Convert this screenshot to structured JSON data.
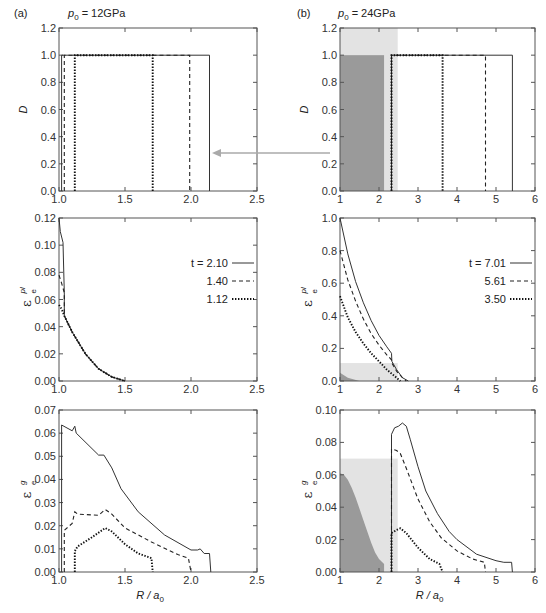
{
  "figure": {
    "panel_a_label": "(a)",
    "panel_b_label": "(b)",
    "panel_a_title": "p0 = 12GPa",
    "panel_b_title": "p0 = 24GPa",
    "panel_a_title_sym": "p",
    "panel_a_title_sub": "0",
    "panel_a_title_rest": " = 12GPa",
    "panel_b_title_sym": "p",
    "panel_b_title_sub": "0",
    "panel_b_title_rest": " = 24GPa",
    "xlabel": "R / a0",
    "caption_fragment": "... distribution of damage D, plastic strain εe^pl and ... strain εe^g at radial distance R/a0 ..."
  },
  "colors": {
    "axis": "#555555",
    "curve": "#222222",
    "arrow": "#aaaaaa",
    "shade_dark": "#9a9a9a",
    "shade_light": "#e3e3e3"
  },
  "chart_data": [
    {
      "id": "a_top",
      "type": "line",
      "title": "p0 = 12GPa",
      "xlabel": "",
      "ylabel": "D",
      "xlim": [
        1.0,
        2.5
      ],
      "ylim": [
        0.0,
        1.2
      ],
      "xticks": [
        "1.0",
        "1.5",
        "2.0",
        "2.5"
      ],
      "yticks": [
        "0.0",
        "0.2",
        "0.4",
        "0.6",
        "0.8",
        "1.0",
        "1.2"
      ],
      "series": [
        {
          "name": "t = 2.10",
          "style": "solid",
          "points": [
            [
              1.02,
              0
            ],
            [
              1.02,
              1.0
            ],
            [
              2.14,
              1.0
            ],
            [
              2.14,
              0
            ]
          ]
        },
        {
          "name": "t = 1.40",
          "style": "dashed",
          "points": [
            [
              1.04,
              0
            ],
            [
              1.04,
              1.0
            ],
            [
              1.99,
              1.0
            ],
            [
              1.99,
              0
            ]
          ]
        },
        {
          "name": "t = 1.12",
          "style": "dotted",
          "points": [
            [
              1.12,
              0
            ],
            [
              1.12,
              1.0
            ],
            [
              1.71,
              1.0
            ],
            [
              1.71,
              0
            ]
          ]
        }
      ]
    },
    {
      "id": "a_mid",
      "type": "line",
      "xlabel": "",
      "ylabel": "εe^pl",
      "xlim": [
        1.0,
        2.5
      ],
      "ylim": [
        0.0,
        0.12
      ],
      "xticks": [
        "1.0",
        "1.5",
        "2.0",
        "2.5"
      ],
      "yticks": [
        "0.00",
        "0.02",
        "0.04",
        "0.06",
        "0.08",
        "0.10",
        "0.12"
      ],
      "legend": [
        {
          "label": "t = 2.10",
          "style": "solid"
        },
        {
          "label": "1.40",
          "style": "dashed"
        },
        {
          "label": "1.12",
          "style": "dotted"
        }
      ],
      "series": [
        {
          "name": "t = 2.10",
          "style": "solid",
          "points": [
            [
              1.0,
              0.12
            ],
            [
              1.01,
              0.11
            ],
            [
              1.03,
              0.102
            ],
            [
              1.04,
              0.065
            ],
            [
              1.04,
              0.048
            ],
            [
              1.1,
              0.036
            ],
            [
              1.2,
              0.02
            ],
            [
              1.3,
              0.009
            ],
            [
              1.4,
              0.003
            ],
            [
              1.5,
              0.0
            ]
          ]
        },
        {
          "name": "t = 1.40",
          "style": "dashed",
          "points": [
            [
              1.0,
              0.078
            ],
            [
              1.02,
              0.072
            ],
            [
              1.04,
              0.065
            ],
            [
              1.04,
              0.048
            ],
            [
              1.1,
              0.036
            ],
            [
              1.2,
              0.02
            ],
            [
              1.3,
              0.009
            ],
            [
              1.4,
              0.003
            ],
            [
              1.5,
              0.0
            ]
          ]
        },
        {
          "name": "t = 1.12",
          "style": "dotted",
          "points": [
            [
              1.0,
              0.056
            ],
            [
              1.02,
              0.053
            ],
            [
              1.04,
              0.048
            ],
            [
              1.1,
              0.036
            ],
            [
              1.2,
              0.02
            ],
            [
              1.3,
              0.009
            ],
            [
              1.4,
              0.003
            ],
            [
              1.5,
              0.0
            ]
          ]
        }
      ]
    },
    {
      "id": "a_bot",
      "type": "line",
      "xlabel": "R / a0",
      "ylabel": "εe^g",
      "xlim": [
        1.0,
        2.5
      ],
      "ylim": [
        0.0,
        0.07
      ],
      "xticks": [
        "1.0",
        "1.5",
        "2.0",
        "2.5"
      ],
      "yticks": [
        "0.00",
        "0.01",
        "0.02",
        "0.03",
        "0.04",
        "0.05",
        "0.06",
        "0.07"
      ],
      "series": [
        {
          "name": "t = 2.10",
          "style": "solid",
          "points": [
            [
              1.02,
              0
            ],
            [
              1.02,
              0.0635
            ],
            [
              1.1,
              0.061
            ],
            [
              1.12,
              0.063
            ],
            [
              1.13,
              0.06
            ],
            [
              1.3,
              0.0505
            ],
            [
              1.34,
              0.0505
            ],
            [
              1.4,
              0.045
            ],
            [
              1.47,
              0.036
            ],
            [
              1.6,
              0.026
            ],
            [
              1.8,
              0.016
            ],
            [
              2.0,
              0.0095
            ],
            [
              2.05,
              0.0095
            ],
            [
              2.07,
              0.01
            ],
            [
              2.1,
              0.008
            ],
            [
              2.14,
              0.008
            ],
            [
              2.15,
              0
            ]
          ]
        },
        {
          "name": "t = 1.40",
          "style": "dashed",
          "points": [
            [
              1.04,
              0
            ],
            [
              1.04,
              0.018
            ],
            [
              1.1,
              0.021
            ],
            [
              1.12,
              0.026
            ],
            [
              1.14,
              0.025
            ],
            [
              1.3,
              0.0245
            ],
            [
              1.35,
              0.027
            ],
            [
              1.4,
              0.025
            ],
            [
              1.5,
              0.019
            ],
            [
              1.7,
              0.013
            ],
            [
              1.9,
              0.0075
            ],
            [
              1.98,
              0.006
            ],
            [
              2.0,
              0.0
            ]
          ]
        },
        {
          "name": "t = 1.12",
          "style": "dotted",
          "points": [
            [
              1.12,
              0
            ],
            [
              1.12,
              0.009
            ],
            [
              1.14,
              0.011
            ],
            [
              1.25,
              0.015
            ],
            [
              1.35,
              0.019
            ],
            [
              1.4,
              0.0175
            ],
            [
              1.5,
              0.012
            ],
            [
              1.6,
              0.008
            ],
            [
              1.7,
              0.006
            ],
            [
              1.71,
              0.0
            ]
          ]
        }
      ]
    },
    {
      "id": "b_top",
      "type": "line",
      "title": "p0 = 24GPa",
      "xlabel": "",
      "ylabel": "D",
      "xlim": [
        1,
        6
      ],
      "ylim": [
        0.0,
        1.2
      ],
      "xticks": [
        "1",
        "2",
        "3",
        "4",
        "5",
        "6"
      ],
      "yticks": [
        "0.0",
        "0.2",
        "0.4",
        "0.6",
        "0.8",
        "1.0",
        "1.2"
      ],
      "shaded_regions": [
        {
          "shade": "light",
          "x": [
            1.0,
            2.48
          ],
          "y": [
            0.0,
            1.2
          ]
        },
        {
          "shade": "dark",
          "x": [
            1.0,
            2.13
          ],
          "y": [
            0.0,
            1.0
          ]
        }
      ],
      "series": [
        {
          "name": "t = 7.01",
          "style": "solid",
          "points": [
            [
              2.32,
              0
            ],
            [
              2.32,
              1.0
            ],
            [
              5.42,
              1.0
            ],
            [
              5.42,
              0
            ]
          ]
        },
        {
          "name": "t = 5.61",
          "style": "dashed",
          "points": [
            [
              2.32,
              0
            ],
            [
              2.32,
              1.0
            ],
            [
              4.73,
              1.0
            ],
            [
              4.73,
              0
            ]
          ]
        },
        {
          "name": "t = 3.50",
          "style": "dotted",
          "points": [
            [
              2.32,
              0
            ],
            [
              2.32,
              1.0
            ],
            [
              3.63,
              1.0
            ],
            [
              3.63,
              0
            ]
          ]
        }
      ]
    },
    {
      "id": "b_mid",
      "type": "line",
      "xlabel": "",
      "ylabel": "εe^pl",
      "xlim": [
        1,
        6
      ],
      "ylim": [
        0.0,
        1.0
      ],
      "xticks": [
        "1",
        "2",
        "3",
        "4",
        "5",
        "6"
      ],
      "yticks": [
        "0.0",
        "0.2",
        "0.4",
        "0.6",
        "0.8",
        "1.0"
      ],
      "shaded_regions": [
        {
          "shade": "light",
          "x": [
            1.0,
            2.48
          ],
          "y": [
            0.0,
            0.11
          ]
        },
        {
          "shade": "dark_curve",
          "points": [
            [
              1.0,
              0.05
            ],
            [
              1.2,
              0.02
            ],
            [
              1.5,
              0.0
            ]
          ]
        }
      ],
      "legend": [
        {
          "label": "t = 7.01",
          "style": "solid"
        },
        {
          "label": "5.61",
          "style": "dashed"
        },
        {
          "label": "3.50",
          "style": "dotted"
        }
      ],
      "series": [
        {
          "name": "t = 7.01",
          "style": "solid",
          "points": [
            [
              1.0,
              1.0
            ],
            [
              1.2,
              0.78
            ],
            [
              1.4,
              0.61
            ],
            [
              1.6,
              0.48
            ],
            [
              1.8,
              0.37
            ],
            [
              2.0,
              0.28
            ],
            [
              2.2,
              0.21
            ],
            [
              2.32,
              0.17
            ],
            [
              2.33,
              0.12
            ],
            [
              2.45,
              0.07
            ],
            [
              2.6,
              0.02
            ],
            [
              2.75,
              0.0
            ]
          ]
        },
        {
          "name": "t = 5.61",
          "style": "dashed",
          "points": [
            [
              1.0,
              0.8
            ],
            [
              1.2,
              0.62
            ],
            [
              1.4,
              0.49
            ],
            [
              1.6,
              0.38
            ],
            [
              1.8,
              0.29
            ],
            [
              2.0,
              0.22
            ],
            [
              2.2,
              0.16
            ],
            [
              2.32,
              0.13
            ],
            [
              2.33,
              0.11
            ],
            [
              2.45,
              0.06
            ],
            [
              2.6,
              0.02
            ],
            [
              2.7,
              0.0
            ]
          ]
        },
        {
          "name": "t = 3.50",
          "style": "dotted",
          "points": [
            [
              1.0,
              0.52
            ],
            [
              1.2,
              0.39
            ],
            [
              1.4,
              0.3
            ],
            [
              1.6,
              0.23
            ],
            [
              1.8,
              0.17
            ],
            [
              2.0,
              0.12
            ],
            [
              2.2,
              0.07
            ],
            [
              2.4,
              0.03
            ],
            [
              2.55,
              0.0
            ]
          ]
        }
      ]
    },
    {
      "id": "b_bot",
      "type": "line",
      "xlabel": "R / a0",
      "ylabel": "εe^g",
      "xlim": [
        1,
        6
      ],
      "ylim": [
        0.0,
        0.1
      ],
      "xticks": [
        "1",
        "2",
        "3",
        "4",
        "5",
        "6"
      ],
      "yticks": [
        "0.00",
        "0.02",
        "0.04",
        "0.06",
        "0.08",
        "0.10"
      ],
      "shaded_regions": [
        {
          "shade": "light",
          "x": [
            1.0,
            2.48
          ],
          "y": [
            0.0,
            0.07
          ]
        },
        {
          "shade": "dark_curve",
          "points": [
            [
              1.0,
              0.0
            ],
            [
              1.0,
              0.061
            ],
            [
              1.1,
              0.06
            ],
            [
              1.2,
              0.057
            ],
            [
              1.3,
              0.052
            ],
            [
              1.4,
              0.046
            ],
            [
              1.5,
              0.039
            ],
            [
              1.6,
              0.032
            ],
            [
              1.7,
              0.025
            ],
            [
              1.8,
              0.018
            ],
            [
              1.9,
              0.012
            ],
            [
              2.0,
              0.008
            ],
            [
              2.13,
              0.005
            ],
            [
              2.13,
              0.0
            ]
          ]
        }
      ],
      "series": [
        {
          "name": "t = 7.01",
          "style": "solid",
          "points": [
            [
              2.32,
              0
            ],
            [
              2.32,
              0.085
            ],
            [
              2.4,
              0.089
            ],
            [
              2.5,
              0.09
            ],
            [
              2.6,
              0.092
            ],
            [
              2.7,
              0.09
            ],
            [
              2.8,
              0.082
            ],
            [
              3.0,
              0.065
            ],
            [
              3.2,
              0.05
            ],
            [
              3.5,
              0.036
            ],
            [
              3.8,
              0.025
            ],
            [
              4.0,
              0.02
            ],
            [
              4.5,
              0.011
            ],
            [
              5.0,
              0.007
            ],
            [
              5.2,
              0.006
            ],
            [
              5.4,
              0.006
            ],
            [
              5.42,
              0.0
            ]
          ]
        },
        {
          "name": "t = 5.61",
          "style": "dashed",
          "points": [
            [
              2.32,
              0
            ],
            [
              2.32,
              0.076
            ],
            [
              2.45,
              0.075
            ],
            [
              2.55,
              0.073
            ],
            [
              2.7,
              0.064
            ],
            [
              3.0,
              0.045
            ],
            [
              3.3,
              0.031
            ],
            [
              3.6,
              0.021
            ],
            [
              4.0,
              0.013
            ],
            [
              4.4,
              0.008
            ],
            [
              4.7,
              0.006
            ],
            [
              4.73,
              0.0
            ]
          ]
        },
        {
          "name": "t = 3.50",
          "style": "dotted",
          "points": [
            [
              2.32,
              0
            ],
            [
              2.32,
              0.024
            ],
            [
              2.45,
              0.026
            ],
            [
              2.55,
              0.027
            ],
            [
              2.7,
              0.024
            ],
            [
              3.0,
              0.015
            ],
            [
              3.3,
              0.008
            ],
            [
              3.55,
              0.005
            ],
            [
              3.63,
              0.0
            ]
          ]
        }
      ]
    }
  ]
}
